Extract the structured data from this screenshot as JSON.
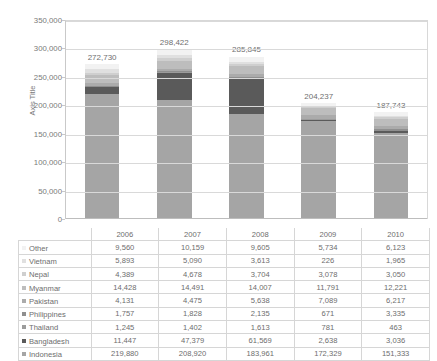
{
  "chart_data": {
    "type": "bar",
    "subtype": "stacked-column",
    "title": "",
    "xlabel": "",
    "ylabel": "Axis Title",
    "ylim": [
      0,
      350000
    ],
    "ytick_step": 50000,
    "ytick_labels": [
      "350,000",
      "300,000",
      "250,000",
      "200,000",
      "150,000",
      "100,000",
      "50,000",
      "0"
    ],
    "ytick_values": [
      350000,
      300000,
      250000,
      200000,
      150000,
      100000,
      50000,
      0
    ],
    "grid": true,
    "legend_position": "table-left-column",
    "categories": [
      "2006",
      "2007",
      "2008",
      "2009",
      "2010"
    ],
    "stack_order_bottom_to_top": [
      "Indonesia",
      "Bangladesh",
      "Thailand",
      "Philippines",
      "Pakistan",
      "Myanmar",
      "Nepal",
      "Vietnam",
      "Other"
    ],
    "series": [
      {
        "name": "Other",
        "color": "#f2f2f2",
        "values": [
          9560,
          10159,
          9605,
          5734,
          6123
        ],
        "display": [
          "9,560",
          "10,159",
          "9,605",
          "5,734",
          "6,123"
        ]
      },
      {
        "name": "Vietnam",
        "color": "#e0e0e0",
        "values": [
          5893,
          5090,
          3613,
          226,
          1965
        ],
        "display": [
          "5,893",
          "5,090",
          "3,613",
          "226",
          "1,965"
        ]
      },
      {
        "name": "Nepal",
        "color": "#cfcfcf",
        "values": [
          4389,
          4678,
          3704,
          3078,
          3050
        ],
        "display": [
          "4,389",
          "4,678",
          "3,704",
          "3,078",
          "3,050"
        ]
      },
      {
        "name": "Myanmar",
        "color": "#bdbdbd",
        "values": [
          14428,
          14491,
          14007,
          11791,
          12221
        ],
        "display": [
          "14,428",
          "14,491",
          "14,007",
          "11,791",
          "12,221"
        ]
      },
      {
        "name": "Pakistan",
        "color": "#ababab",
        "values": [
          4131,
          4475,
          5638,
          7089,
          6217
        ],
        "display": [
          "4,131",
          "4,475",
          "5,638",
          "7,089",
          "6,217"
        ]
      },
      {
        "name": "Philippines",
        "color": "#8f8f8f",
        "values": [
          1757,
          1828,
          2135,
          671,
          3335
        ],
        "display": [
          "1,757",
          "1,828",
          "2,135",
          "671",
          "3,335"
        ]
      },
      {
        "name": "Thailand",
        "color": "#9c9c9c",
        "values": [
          1245,
          1402,
          1613,
          781,
          463
        ],
        "display": [
          "1,245",
          "1,402",
          "1,613",
          "781",
          "463"
        ]
      },
      {
        "name": "Bangladesh",
        "color": "#5a5a5a",
        "values": [
          11447,
          47379,
          61569,
          2638,
          3036
        ],
        "display": [
          "11,447",
          "47,379",
          "61,569",
          "2,638",
          "3,036"
        ]
      },
      {
        "name": "Indonesia",
        "color": "#a5a5a5",
        "values": [
          219880,
          208920,
          183961,
          172329,
          151333
        ],
        "display": [
          "219,880",
          "208,920",
          "183,961",
          "172,329",
          "151,333"
        ]
      }
    ],
    "totals": [
      272730,
      298422,
      285845,
      204237,
      187743
    ],
    "total_labels": [
      "272,730",
      "298,422",
      "285,845",
      "204,237",
      "187,743"
    ]
  },
  "table": {
    "corner_label": "",
    "column_headers": [
      "2006",
      "2007",
      "2008",
      "2009",
      "2010"
    ]
  },
  "colors": {
    "gridline": "#d9d9d9",
    "axis": "#c9c9c9",
    "text": "#6d6d6d",
    "table_border": "#d6d6d6",
    "background": "#ffffff"
  }
}
